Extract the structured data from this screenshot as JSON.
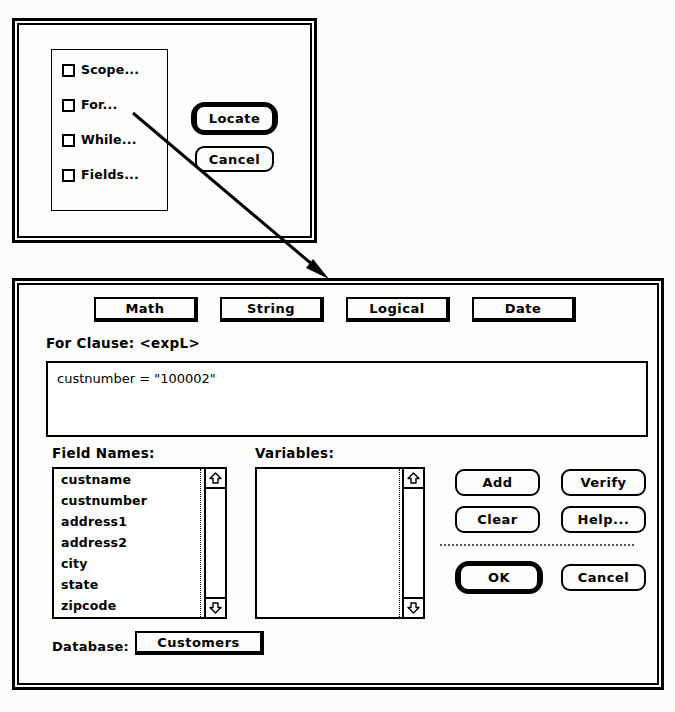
{
  "locate_dialog": {
    "name": "Locate dialog",
    "checkboxes": [
      {
        "label": "Scope...",
        "checked": false
      },
      {
        "label": "For...",
        "checked": false
      },
      {
        "label": "While...",
        "checked": false
      },
      {
        "label": "Fields...",
        "checked": false
      }
    ],
    "buttons": [
      {
        "label": "Locate",
        "default": true
      },
      {
        "label": "Cancel",
        "default": false
      }
    ]
  },
  "expression_dialog": {
    "name": "Expression Builder dialog",
    "category_buttons": [
      {
        "label": "Math"
      },
      {
        "label": "String"
      },
      {
        "label": "Logical"
      },
      {
        "label": "Date"
      }
    ],
    "clause": {
      "label": "For Clause: <expL>",
      "expression": "custnumber = \"100002\""
    },
    "field_names": {
      "label": "Field Names:",
      "rows": [
        {
          "name": "custname",
          "type": "C"
        },
        {
          "name": "custnumber",
          "type": "C"
        },
        {
          "name": "address1",
          "type": "C"
        },
        {
          "name": "address2",
          "type": "C"
        },
        {
          "name": "city",
          "type": "C"
        },
        {
          "name": "state",
          "type": "C"
        },
        {
          "name": "zipcode",
          "type": "C"
        }
      ]
    },
    "variables": {
      "label": "Variables:",
      "rows": []
    },
    "action_buttons": [
      {
        "label": "Add",
        "default": false
      },
      {
        "label": "Verify",
        "default": false
      },
      {
        "label": "Clear",
        "default": false
      },
      {
        "label": "Help...",
        "default": false
      },
      {
        "label": "OK",
        "default": true
      },
      {
        "label": "Cancel",
        "default": false
      }
    ],
    "database": {
      "label": "Database:",
      "value": "Customers"
    }
  },
  "icons": {
    "scroll_up": "scroll-up-arrow-icon",
    "scroll_down": "scroll-down-arrow-icon",
    "pointer": "callout-arrow-icon"
  },
  "colors": {
    "ink": "#000000",
    "paper": "#fdfdfc",
    "field": "#ffffff"
  }
}
